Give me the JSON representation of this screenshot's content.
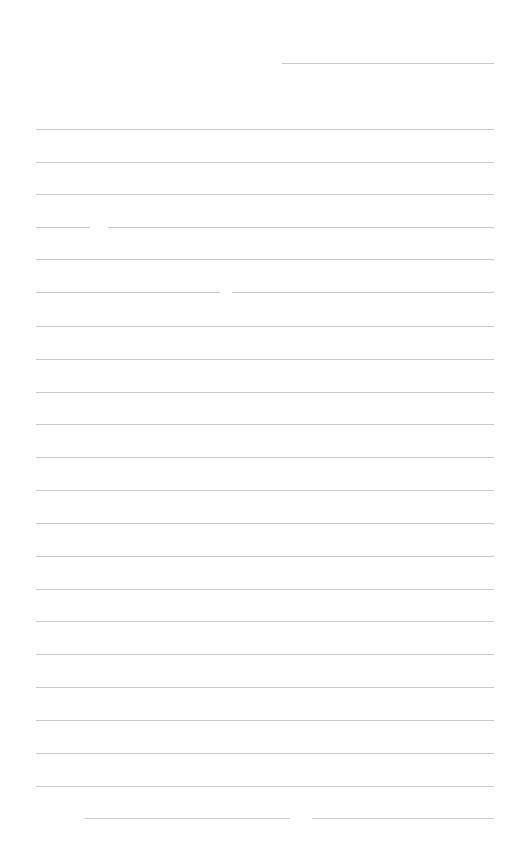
{
  "page": {
    "type": "blank lined writing paper",
    "background_color": "#fefefe",
    "rule_color": "#c9c9c9",
    "header_line": {
      "y": 63,
      "x_start": 282,
      "x_end": 494
    },
    "ruled_lines": [
      {
        "y": 129,
        "segments": [
          [
            36,
            494
          ]
        ]
      },
      {
        "y": 162,
        "segments": [
          [
            36,
            494
          ]
        ]
      },
      {
        "y": 194,
        "segments": [
          [
            36,
            494
          ]
        ]
      },
      {
        "y": 227,
        "segments": [
          [
            36,
            90
          ],
          [
            108,
            494
          ]
        ]
      },
      {
        "y": 259,
        "segments": [
          [
            36,
            494
          ]
        ]
      },
      {
        "y": 292,
        "segments": [
          [
            36,
            220
          ],
          [
            232,
            494
          ]
        ]
      },
      {
        "y": 326,
        "segments": [
          [
            36,
            494
          ]
        ]
      },
      {
        "y": 359,
        "segments": [
          [
            36,
            494
          ]
        ]
      },
      {
        "y": 392,
        "segments": [
          [
            36,
            494
          ]
        ]
      },
      {
        "y": 424,
        "segments": [
          [
            36,
            494
          ]
        ]
      },
      {
        "y": 457,
        "segments": [
          [
            36,
            494
          ]
        ]
      },
      {
        "y": 490,
        "segments": [
          [
            36,
            494
          ]
        ]
      },
      {
        "y": 523,
        "segments": [
          [
            36,
            494
          ]
        ]
      },
      {
        "y": 556,
        "segments": [
          [
            36,
            494
          ]
        ]
      },
      {
        "y": 589,
        "segments": [
          [
            36,
            494
          ]
        ]
      },
      {
        "y": 621,
        "segments": [
          [
            36,
            494
          ]
        ]
      },
      {
        "y": 654,
        "segments": [
          [
            36,
            494
          ]
        ]
      },
      {
        "y": 687,
        "segments": [
          [
            36,
            494
          ]
        ]
      },
      {
        "y": 720,
        "segments": [
          [
            36,
            494
          ]
        ]
      },
      {
        "y": 753,
        "segments": [
          [
            36,
            494
          ]
        ]
      },
      {
        "y": 786,
        "segments": [
          [
            36,
            494
          ]
        ]
      },
      {
        "y": 818,
        "segments": [
          [
            85,
            290
          ],
          [
            312,
            494
          ]
        ]
      }
    ]
  }
}
